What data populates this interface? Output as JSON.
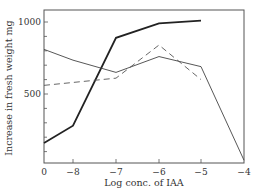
{
  "chart_data": {
    "type": "line",
    "title": "",
    "xlabel": "Log conc. of IAA",
    "ylabel": "Increase in fresh weight mg",
    "x_tick_labels": [
      "0",
      "−8",
      "−7",
      "−6",
      "−5",
      "−4"
    ],
    "x": [
      0,
      -8,
      -7,
      -6,
      -5,
      -4
    ],
    "y_tick_labels": [
      "500",
      "1000"
    ],
    "y_minor_tick_step": 100,
    "ylim": [
      0,
      1100
    ],
    "grid": false,
    "legend": null,
    "series": [
      {
        "name": "thick solid",
        "style": "solid-thick",
        "x": [
          0,
          -8,
          -7,
          -6,
          -5
        ],
        "values": [
          160,
          280,
          890,
          990,
          1010
        ]
      },
      {
        "name": "thin solid",
        "style": "solid-thin",
        "x": [
          0,
          -8,
          -7,
          -6,
          -5,
          -4
        ],
        "values": [
          810,
          735,
          650,
          760,
          690,
          40
        ]
      },
      {
        "name": "dashed",
        "style": "dashed",
        "x": [
          0,
          -7,
          -6,
          -5
        ],
        "values": [
          560,
          610,
          840,
          600
        ]
      }
    ]
  }
}
